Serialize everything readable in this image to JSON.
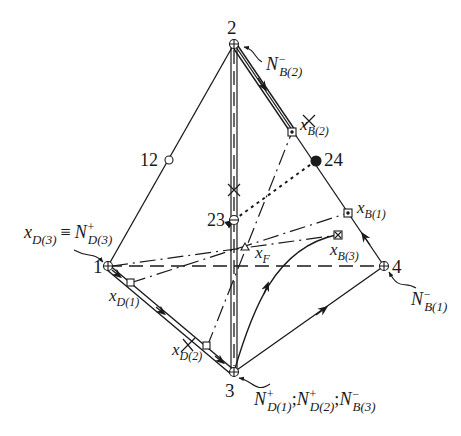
{
  "diagram": {
    "type": "tetrahedron-distillation-diagram",
    "vertices": [
      {
        "id": "1",
        "label": "1",
        "x": 108,
        "y": 266
      },
      {
        "id": "2",
        "label": "2",
        "x": 234,
        "y": 44
      },
      {
        "id": "3",
        "label": "3",
        "x": 234,
        "y": 372
      },
      {
        "id": "4",
        "label": "4",
        "x": 384,
        "y": 266
      }
    ],
    "edge_points": [
      {
        "id": "12",
        "label": "12",
        "type": "open-circle"
      },
      {
        "id": "23",
        "label": "23",
        "type": "crossed-circle"
      },
      {
        "id": "24",
        "label": "24",
        "type": "filled-circle"
      }
    ],
    "compositions": {
      "xF": {
        "base": "x",
        "sub": "F"
      },
      "xD1": {
        "base": "x",
        "sub": "D(1)"
      },
      "xD2": {
        "base": "x",
        "sub": "D(2)"
      },
      "xD3": {
        "base": "x",
        "sub": "D(3)"
      },
      "xB1": {
        "base": "x",
        "sub": "B(1)"
      },
      "xB2": {
        "base": "x",
        "sub": "B(2)"
      },
      "xB3": {
        "base": "x",
        "sub": "B(3)"
      }
    },
    "node_labels": {
      "top": {
        "base": "N",
        "sup": "−",
        "sub": "B(2)"
      },
      "right": {
        "base": "N",
        "sup": "−",
        "sub": "B(1)"
      },
      "left_equiv": "≡",
      "left": {
        "base": "N",
        "sup": "+",
        "sub": "D(3)"
      },
      "bottom": [
        {
          "base": "N",
          "sup": "+",
          "sub": "D(1)"
        },
        {
          "base": "N",
          "sup": "+",
          "sub": "D(2)"
        },
        {
          "base": "N",
          "sup": "−",
          "sub": "B(3)"
        }
      ],
      "separator": ";"
    },
    "colors": {
      "ink": "#1a1a1a",
      "background": "#ffffff"
    }
  }
}
